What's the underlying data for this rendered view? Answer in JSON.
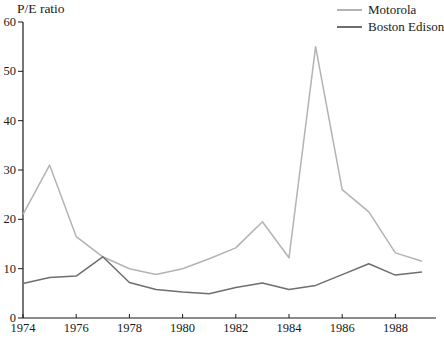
{
  "chart_data": {
    "type": "line",
    "title": "",
    "ylabel": "P/E ratio",
    "xlabel": "",
    "x": [
      1974,
      1975,
      1976,
      1977,
      1978,
      1979,
      1980,
      1981,
      1982,
      1983,
      1984,
      1985,
      1986,
      1987,
      1988,
      1989
    ],
    "series": [
      {
        "name": "Motorola",
        "color": "#b3b3b3",
        "values": [
          21,
          31,
          16.5,
          12.4,
          10,
          8.8,
          10,
          12,
          14.2,
          19.5,
          12.2,
          55,
          26,
          21.5,
          13.2,
          11.5
        ]
      },
      {
        "name": "Boston Edison",
        "color": "#6e6e6e",
        "values": [
          7,
          8.2,
          8.5,
          12.4,
          7.2,
          5.8,
          5.3,
          4.9,
          6.2,
          7.1,
          5.8,
          6.6,
          8.8,
          11,
          8.7,
          9.3
        ]
      }
    ],
    "ylim": [
      0,
      60
    ],
    "yticks": [
      0,
      10,
      20,
      30,
      40,
      50,
      60
    ],
    "xticks": [
      1974,
      1976,
      1978,
      1980,
      1982,
      1984,
      1986,
      1988
    ],
    "grid": false,
    "legend_position": "top-right",
    "axis_color": "#1a1a1a"
  }
}
